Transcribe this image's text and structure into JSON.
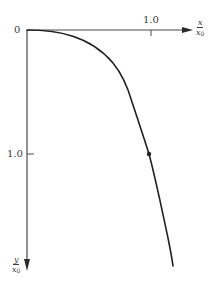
{
  "diagram": {
    "type": "curve-plot",
    "origin_label": "0",
    "x_axis": {
      "label_numerator": "x",
      "label_denominator_var": "x",
      "label_denominator_sub": "0",
      "tick_label": "1.0",
      "direction": "right"
    },
    "y_axis": {
      "label_numerator": "y",
      "label_denominator_var": "x",
      "label_denominator_sub": "0",
      "tick_label": "1.0",
      "direction": "down"
    },
    "curve": {
      "description": "Curve starting horizontally at origin, bending downward and steepening",
      "points_normalized": [
        [
          0.0,
          0.0
        ],
        [
          0.32,
          0.056
        ],
        [
          0.53,
          0.136
        ],
        [
          0.69,
          0.264
        ],
        [
          0.78,
          0.48
        ],
        [
          0.86,
          0.72
        ],
        [
          0.92,
          0.88
        ],
        [
          0.98,
          1.0
        ],
        [
          1.0,
          1.05
        ],
        [
          1.07,
          1.37
        ],
        [
          1.13,
          1.65
        ],
        [
          1.18,
          1.9
        ]
      ],
      "marked_point": [
        0.98,
        1.0
      ],
      "color": "#222222"
    },
    "colors": {
      "axis": "#4a4a4a",
      "curve": "#222222",
      "background": "#ffffff"
    }
  }
}
